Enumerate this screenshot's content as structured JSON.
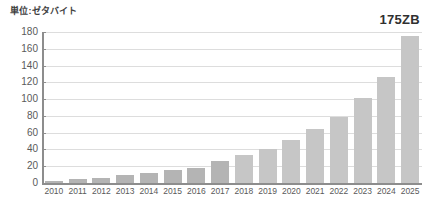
{
  "chart_data": {
    "type": "bar",
    "title": "単位:ゼタバイト",
    "xlabel": "",
    "ylabel": "",
    "ylim": [
      0,
      180
    ],
    "ytick_step": 20,
    "yticks": [
      180,
      160,
      140,
      120,
      100,
      80,
      60,
      40,
      20,
      0
    ],
    "grid": true,
    "legend": false,
    "categories": [
      "2010",
      "2011",
      "2012",
      "2013",
      "2014",
      "2015",
      "2016",
      "2017",
      "2018",
      "2019",
      "2020",
      "2021",
      "2022",
      "2023",
      "2024",
      "2025"
    ],
    "values": [
      2,
      5,
      6.5,
      9,
      12.5,
      15.5,
      18,
      26,
      33,
      41,
      51,
      64,
      79,
      101,
      126,
      175
    ],
    "annotations": [
      {
        "text": "175ZB",
        "position": "top-right",
        "refers_to_category": "2025"
      }
    ],
    "series_colors": {
      "bar_light": "#c6c6c6",
      "bar_dark": "#b4b4b4",
      "gridline": "#dddddd",
      "axis": "#8d8d8d",
      "text": "#5a5a5a"
    },
    "dark_bar_categories": [
      "2010",
      "2011",
      "2012",
      "2013",
      "2014",
      "2015",
      "2016",
      "2017"
    ]
  }
}
